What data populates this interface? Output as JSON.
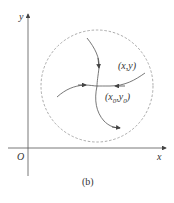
{
  "figure": {
    "caption": "(b)",
    "axes": {
      "x_label": "x",
      "y_label": "y",
      "origin_label": "O"
    },
    "point_labels": {
      "xy": "(x,y)",
      "x0y0_prefix": "(x",
      "x0y0_sub1": "0",
      "x0y0_mid": ",y",
      "x0y0_sub2": "0",
      "x0y0_suffix": ")"
    },
    "colors": {
      "stroke": "#555555",
      "circle": "#888888",
      "text": "#333333"
    }
  }
}
